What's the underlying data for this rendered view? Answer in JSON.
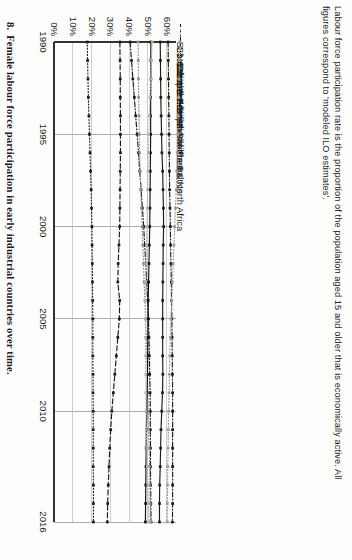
{
  "figure": {
    "note": "Labour force participation rate is the proportion of the population aged 15 and older that is economically active. All figures correspond to 'modeled ILO estimates'.",
    "caption_number": "8.",
    "caption_text": "Female labour force participation in early industrial countries over time."
  },
  "chart_data": {
    "type": "line",
    "title": "",
    "xlabel": "",
    "ylabel": "",
    "grid": true,
    "legend_position": "top",
    "xlim": [
      1990,
      2016
    ],
    "ylim": [
      0,
      65
    ],
    "x": [
      1990,
      1991,
      1992,
      1993,
      1994,
      1995,
      1996,
      1997,
      1998,
      1999,
      2000,
      2001,
      2002,
      2003,
      2004,
      2005,
      2006,
      2007,
      2008,
      2009,
      2010,
      2011,
      2012,
      2013,
      2014,
      2015,
      2016
    ],
    "xticks": [
      "1990",
      "1995",
      "2000",
      "2005",
      "2010",
      "2016"
    ],
    "yticks": [
      "0%",
      "10%",
      "20%",
      "30%",
      "40%",
      "50%",
      "60%"
    ],
    "series": [
      {
        "name": "Sub-Saharan Africa",
        "style": "dashdot",
        "color": "#1a1a1a",
        "values": [
          60.8,
          60.9,
          61.0,
          61.1,
          61.2,
          61.3,
          61.4,
          61.5,
          61.6,
          61.8,
          62.0,
          62.1,
          62.3,
          62.5,
          62.6,
          62.8,
          62.9,
          63.0,
          63.1,
          63.2,
          63.2,
          63.2,
          63.2,
          63.2,
          63.2,
          63.2,
          63.1
        ]
      },
      {
        "name": "East Asia & Pacific",
        "style": "dotted",
        "color": "#9a9a9a",
        "values": [
          67.0,
          66.8,
          66.6,
          66.4,
          66.2,
          66.0,
          65.7,
          65.4,
          65.1,
          64.7,
          64.3,
          63.9,
          63.5,
          63.1,
          62.7,
          62.3,
          62.0,
          61.7,
          61.5,
          61.3,
          61.1,
          60.9,
          60.8,
          60.6,
          60.5,
          60.4,
          60.3
        ]
      },
      {
        "name": "North America",
        "style": "solid",
        "color": "#1a1a1a",
        "values": [
          56.6,
          56.7,
          56.8,
          56.9,
          57.1,
          57.3,
          57.5,
          57.9,
          58.1,
          58.3,
          58.4,
          58.2,
          58.1,
          58.0,
          57.9,
          57.9,
          57.9,
          57.9,
          58.0,
          57.8,
          57.4,
          57.0,
          56.8,
          56.6,
          56.3,
          56.2,
          56.2
        ]
      },
      {
        "name": "Latin America & Caribbean",
        "style": "dashdot",
        "color": "#1a1a1a",
        "values": [
          40.6,
          41.3,
          42.0,
          42.8,
          43.5,
          44.3,
          45.0,
          45.7,
          46.4,
          47.1,
          47.8,
          48.3,
          48.9,
          49.4,
          49.9,
          50.3,
          50.6,
          50.8,
          51.0,
          51.2,
          51.3,
          51.3,
          51.4,
          51.4,
          51.5,
          51.6,
          51.7
        ]
      },
      {
        "name": "European Union",
        "style": "dotted",
        "color": "#8f8f8f",
        "values": [
          44.8,
          44.9,
          45.0,
          45.1,
          45.3,
          45.4,
          45.6,
          45.9,
          46.2,
          46.6,
          47.0,
          47.3,
          47.7,
          48.0,
          48.4,
          48.8,
          49.2,
          49.5,
          49.8,
          50.0,
          50.2,
          50.4,
          50.7,
          50.9,
          51.1,
          51.2,
          51.4
        ]
      },
      {
        "name": "World",
        "style": "solid",
        "color": "#111111",
        "values": [
          51.6,
          51.6,
          51.6,
          51.5,
          51.5,
          51.5,
          51.4,
          51.3,
          51.2,
          51.1,
          51.0,
          50.8,
          50.6,
          50.4,
          50.2,
          50.1,
          50.0,
          49.9,
          49.8,
          49.6,
          49.4,
          49.2,
          49.1,
          49.0,
          48.9,
          48.8,
          48.7
        ]
      },
      {
        "name": "Central Europe and the Baltics",
        "style": "dotted",
        "color": "#b2b2b2",
        "values": [
          52.3,
          51.9,
          51.5,
          51.1,
          50.8,
          50.5,
          50.3,
          50.1,
          49.9,
          49.7,
          49.5,
          49.3,
          49.1,
          48.9,
          48.8,
          48.7,
          48.7,
          48.8,
          48.9,
          49.0,
          49.1,
          49.2,
          49.4,
          49.7,
          50.0,
          50.3,
          50.6
        ]
      },
      {
        "name": "South Asia",
        "style": "dashed",
        "color": "#1a1a1a",
        "values": [
          35.1,
          35.2,
          35.3,
          35.3,
          35.4,
          35.4,
          35.4,
          35.3,
          35.2,
          35.1,
          35.0,
          34.6,
          34.2,
          34.0,
          35.0,
          34.8,
          34.0,
          33.2,
          32.4,
          31.6,
          30.8,
          30.2,
          29.7,
          29.3,
          28.9,
          28.6,
          28.4
        ]
      },
      {
        "name": "Middle East & North Africa",
        "style": "dotted",
        "color": "#1a1a1a",
        "values": [
          17.7,
          17.9,
          18.1,
          18.3,
          18.6,
          18.9,
          19.2,
          19.5,
          19.8,
          20.0,
          20.2,
          20.3,
          20.4,
          20.5,
          20.6,
          20.7,
          20.7,
          20.7,
          20.8,
          20.8,
          20.9,
          20.9,
          20.9,
          20.9,
          21.0,
          21.0,
          21.0
        ]
      }
    ]
  }
}
